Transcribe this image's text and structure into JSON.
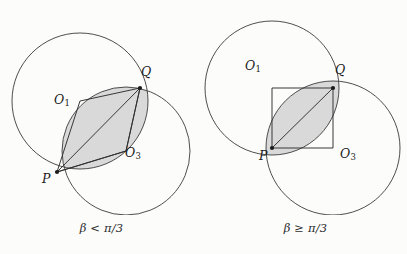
{
  "figure": {
    "background_color": "#fcfcfb",
    "stroke_color": "#3a3a3a",
    "shade_color": "#d9d9d9",
    "shade_stroke": "#4a4a4a"
  },
  "panels": [
    {
      "id": "left",
      "caption": "β < π/3",
      "labels": {
        "O1": "O",
        "O1_sub": "1",
        "O3": "O",
        "O3_sub": "3",
        "P": "P",
        "Q": "Q"
      },
      "geometry": {
        "circle1": {
          "cx": 80,
          "cy": 101,
          "r": 68
        },
        "circle2": {
          "cx": 126,
          "cy": 151,
          "r": 64
        },
        "P": {
          "x": 57,
          "y": 172
        },
        "Q": {
          "x": 140,
          "y": 88
        },
        "O1": {
          "x": 80,
          "y": 101
        },
        "O3": {
          "x": 126,
          "y": 151
        },
        "shaded_region": "lens between P and Q on lower-right side"
      }
    },
    {
      "id": "right",
      "caption": "β ≥ π/3",
      "labels": {
        "O1": "O",
        "O1_sub": "1",
        "O3": "O",
        "O3_sub": "3",
        "P": "P",
        "Q": "Q"
      },
      "geometry": {
        "circle1": {
          "cx": 68,
          "cy": 88,
          "r": 67
        },
        "circle2": {
          "cx": 129,
          "cy": 148,
          "r": 67
        },
        "P": {
          "x": 68,
          "y": 148
        },
        "Q": {
          "x": 129,
          "y": 88
        },
        "O1": {
          "x": 68,
          "y": 88
        },
        "O3": {
          "x": 129,
          "y": 148
        },
        "shaded_region": "lens between P and Q"
      }
    }
  ]
}
